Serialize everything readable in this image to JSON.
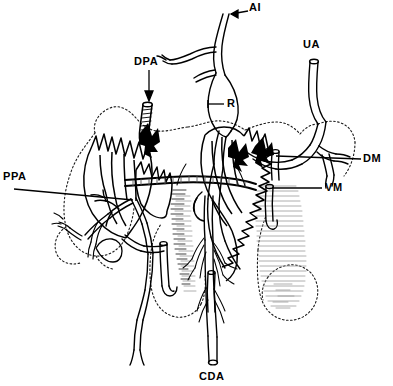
{
  "figure": {
    "kind": "anatomical-line-drawing",
    "background_color": "#ffffff",
    "ink_color": "#000000",
    "shading_color": "#888888",
    "outline_style": "dotted",
    "width": 393,
    "height": 386
  },
  "labels": [
    {
      "id": "ai",
      "text": "AI",
      "x": 251,
      "y": 3,
      "leader": "arrow",
      "leader_from": [
        248,
        12
      ],
      "leader_to": [
        225,
        15
      ]
    },
    {
      "id": "ua",
      "text": "UA",
      "x": 305,
      "y": 40,
      "leader": "none",
      "leader_from": [
        312,
        54
      ],
      "leader_to": [
        312,
        62
      ]
    },
    {
      "id": "dpa",
      "text": "DPA",
      "x": 136,
      "y": 57,
      "leader": "arrow-down",
      "leader_from": [
        149,
        72
      ],
      "leader_to": [
        149,
        100
      ]
    },
    {
      "id": "r",
      "text": "R",
      "x": 226,
      "y": 99,
      "leader": "line",
      "leader_from": [
        223,
        104
      ],
      "leader_to": [
        207,
        104
      ]
    },
    {
      "id": "ppa",
      "text": "PPA",
      "x": 4,
      "y": 172,
      "leader": "line",
      "leader_from": [
        13,
        190
      ],
      "leader_to": [
        131,
        199
      ]
    },
    {
      "id": "dm",
      "text": "DM",
      "x": 364,
      "y": 154,
      "leader": "line",
      "leader_from": [
        361,
        160
      ],
      "leader_to": [
        272,
        156
      ]
    },
    {
      "id": "vm",
      "text": "VM",
      "x": 325,
      "y": 183,
      "leader": "line",
      "leader_from": [
        322,
        189
      ],
      "leader_to": [
        271,
        189
      ]
    },
    {
      "id": "cda",
      "text": "CDA",
      "x": 201,
      "y": 372,
      "leader": "none",
      "leader_from": [
        213,
        370
      ],
      "leader_to": [
        213,
        362
      ]
    }
  ],
  "legend_meanings": {
    "AI": "AI",
    "UA": "UA",
    "DPA": "DPA",
    "R": "R",
    "PPA": "PPA",
    "DM": "DM",
    "VM": "VM",
    "CDA": "CDA"
  }
}
